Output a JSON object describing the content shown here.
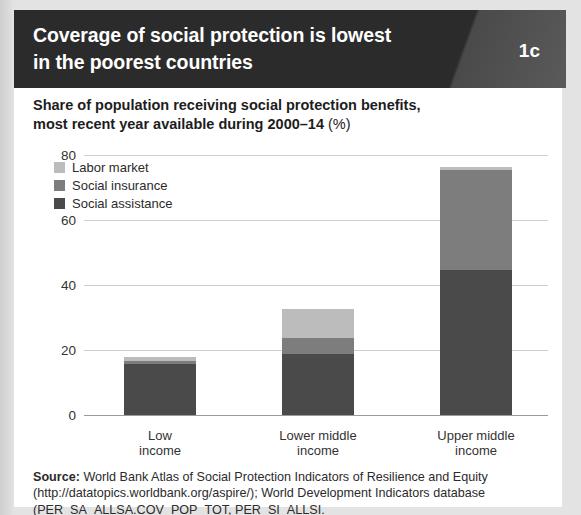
{
  "header": {
    "title_line1": "Coverage of social protection is lowest",
    "title_line2": "in the poorest countries",
    "badge": "1c",
    "background_color": "#2b2b2b"
  },
  "subtitle": {
    "line1": "Share of population receiving social protection benefits,",
    "line2": "most recent year available during 2000–14",
    "unit": "(%)"
  },
  "legend": {
    "items": [
      {
        "label": "Labor market",
        "color": "#bcbcbc"
      },
      {
        "label": "Social insurance",
        "color": "#7d7d7d"
      },
      {
        "label": "Social assistance",
        "color": "#4a4a4a"
      }
    ]
  },
  "axis": {
    "yticks": [
      "80",
      "60",
      "40",
      "20",
      "0"
    ],
    "xlabels": [
      {
        "line1": "Low",
        "line2": "income"
      },
      {
        "line1": "Lower middle",
        "line2": "income"
      },
      {
        "line1": "Upper middle",
        "line2": "income"
      }
    ]
  },
  "source": {
    "label": "Source:",
    "text": " World Bank Atlas of Social Protection Indicators of Resilience and Equity (http://datatopics.worldbank.org/aspire/); World Development Indicators database (PER_SA_ALLSA.COV_POP_TOT, PER_SI_ALLSI."
  },
  "chart_data": {
    "type": "bar",
    "stacked": true,
    "title": "Coverage of social protection is lowest in the poorest countries",
    "subtitle": "Share of population receiving social protection benefits, most recent year available during 2000–14 (%)",
    "xlabel": "",
    "ylabel": "",
    "ylim": [
      0,
      80
    ],
    "yticks": [
      0,
      20,
      40,
      60,
      80
    ],
    "grid": true,
    "legend_position": "top-left",
    "categories": [
      "Low income",
      "Lower middle income",
      "Upper middle income"
    ],
    "series": [
      {
        "name": "Social assistance",
        "color": "#4a4a4a",
        "values": [
          15.7,
          18.8,
          44.6
        ]
      },
      {
        "name": "Social insurance",
        "color": "#7d7d7d",
        "values": [
          0.9,
          4.9,
          30.8
        ]
      },
      {
        "name": "Labor market",
        "color": "#bcbcbc",
        "values": [
          1.4,
          8.9,
          0.9
        ]
      }
    ],
    "totals": [
      18.0,
      32.6,
      76.3
    ]
  }
}
